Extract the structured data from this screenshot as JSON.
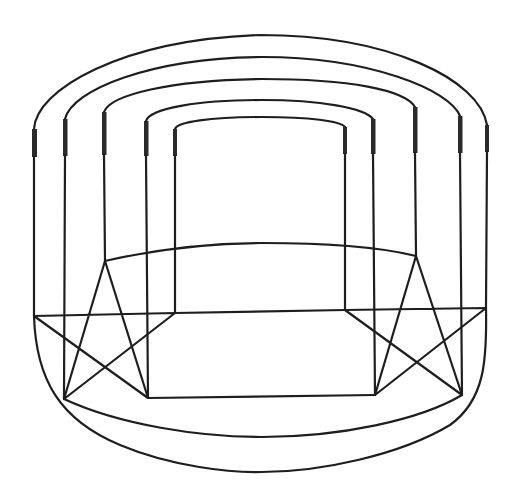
{
  "figure": {
    "type": "line-drawing",
    "stroke_color": "#1e1e1e",
    "background": "#ffffff"
  },
  "stars": [
    {
      "name": "left-pentagram",
      "points": {
        "top": [
          105,
          261
        ],
        "left": [
          34,
          316
        ],
        "right": [
          175,
          313
        ],
        "bottom_left": [
          64,
          399
        ],
        "bottom_right": [
          148,
          398
        ]
      }
    },
    {
      "name": "right-pentagram",
      "points": {
        "top": [
          416,
          256
        ],
        "left": [
          345,
          310
        ],
        "right": [
          486,
          308
        ],
        "bottom_left": [
          375,
          395
        ],
        "bottom_right": [
          462,
          395
        ]
      }
    }
  ],
  "posts": [
    {
      "x": 34,
      "terminal": [
        129,
        157
      ],
      "bottom": 316
    },
    {
      "x": 65,
      "terminal": [
        119,
        156
      ],
      "bottom": 399
    },
    {
      "x": 104,
      "terminal": [
        112,
        155
      ],
      "bottom": 261
    },
    {
      "x": 146,
      "terminal": [
        121,
        156
      ],
      "bottom": 398
    },
    {
      "x": 175,
      "terminal": [
        129,
        156
      ],
      "bottom": 313
    },
    {
      "x": 345,
      "terminal": [
        127,
        154
      ],
      "bottom": 310
    },
    {
      "x": 373,
      "terminal": [
        119,
        154
      ],
      "bottom": 395
    },
    {
      "x": 415,
      "terminal": [
        107,
        153
      ],
      "bottom": 256
    },
    {
      "x": 460,
      "terminal": [
        116,
        153
      ],
      "bottom": 395
    },
    {
      "x": 487,
      "terminal": [
        125,
        152
      ],
      "bottom": 308
    }
  ],
  "top_arcs": [
    {
      "from_x": 34,
      "to_x": 487,
      "peak_y": 35
    },
    {
      "from_x": 65,
      "to_x": 460,
      "peak_y": 57
    },
    {
      "from_x": 104,
      "to_x": 415,
      "peak_y": 79
    },
    {
      "from_x": 146,
      "to_x": 373,
      "peak_y": 100
    },
    {
      "from_x": 175,
      "to_x": 345,
      "peak_y": 117
    }
  ]
}
